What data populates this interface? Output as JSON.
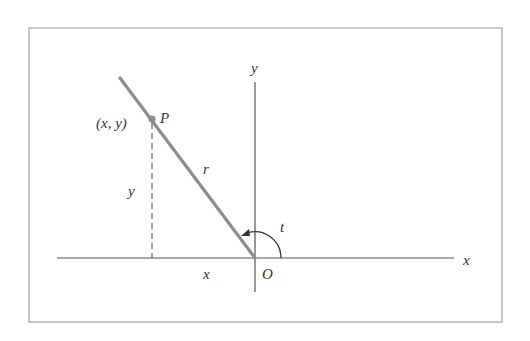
{
  "diagram": {
    "type": "polar-coordinate-angle-diagram",
    "frame": {
      "x": 29,
      "y": 28,
      "width": 473,
      "height": 294,
      "stroke": "#b5b5b5"
    },
    "axes": {
      "color": "#555555",
      "origin": {
        "x": 255,
        "y": 258
      },
      "x_axis": {
        "x1": 57,
        "x2": 454,
        "label": "x"
      },
      "y_axis": {
        "y1": 82,
        "y2": 292,
        "label": "y"
      }
    },
    "terminal_ray": {
      "color": "#8c8c8c",
      "from": {
        "x": 255,
        "y": 258
      },
      "to": {
        "x": 120,
        "y": 78
      },
      "label": "r"
    },
    "point": {
      "name": "P",
      "coords_label": "(x, y)",
      "x": 152,
      "y": 119,
      "color": "#8c8c8c"
    },
    "projection": {
      "style": "dashed",
      "label_vertical": "y",
      "label_horizontal": "x"
    },
    "angle": {
      "label": "t",
      "radius": 26,
      "direction": "counterclockwise"
    },
    "origin_label": "O"
  }
}
